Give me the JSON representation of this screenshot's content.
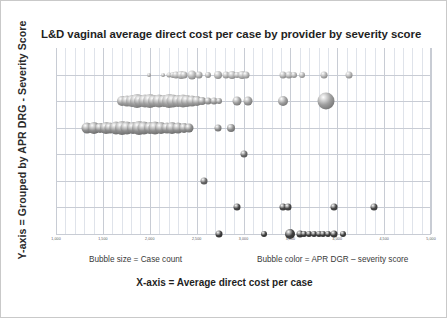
{
  "title": "L&D vaginal average direct cost per case by provider by severity score",
  "axes": {
    "y_caption": "Y-axis = Grouped by APR DRG - Severity Score",
    "x_caption": "X-axis = Average direct cost per case"
  },
  "captions": {
    "bubble_size": "Bubble size = Case count",
    "bubble_color": "Bubble color = APR DGR – severity score"
  },
  "colors": {
    "grid_major": "#c8ccd4",
    "grid_minor": "#dfe3ea",
    "bubble_light": "#b3b3b3",
    "bubble_mid": "#8a8a8a",
    "bubble_dark": "#3f3f3f",
    "title_text": "#1f1f1f",
    "tick_text": "#55585c",
    "frame": "#c9c9c9"
  },
  "chart_data": {
    "type": "scatter",
    "title": "L&D vaginal average direct cost per case by provider by severity score",
    "xlabel": "X-axis = Average direct cost per case",
    "ylabel": "Y-axis = Grouped by APR DRG - Severity Score",
    "grid": true,
    "legend": "none",
    "xlim": [
      1000,
      5000
    ],
    "xticks": [
      1000,
      1500,
      2000,
      2500,
      3000,
      3500,
      4000,
      4500,
      5000
    ],
    "xtick_labels": [
      "1,000",
      "1,500",
      "2,000",
      "2,500",
      "3,000",
      "3,500",
      "4,000",
      "4,500",
      "5,000"
    ],
    "x_minor_step": 100,
    "ylim": [
      0,
      7
    ],
    "yticks": [
      1,
      2,
      3,
      4,
      5,
      6
    ],
    "ytick_labels": [
      "",
      "",
      "",
      "",
      "",
      ""
    ],
    "size_encodes": "Case count",
    "color_encodes": "APR DGR – severity score",
    "series": [
      {
        "name": "Severity score row 1 (light)",
        "row": 1,
        "color": "#b3b3b3",
        "points": [
          {
            "x": 1990,
            "size": 4
          },
          {
            "x": 2140,
            "size": 4
          },
          {
            "x": 2210,
            "size": 5
          },
          {
            "x": 2245,
            "size": 6
          },
          {
            "x": 2280,
            "size": 7
          },
          {
            "x": 2330,
            "size": 8
          },
          {
            "x": 2370,
            "size": 7
          },
          {
            "x": 2450,
            "size": 9
          },
          {
            "x": 2530,
            "size": 7
          },
          {
            "x": 2620,
            "size": 6
          },
          {
            "x": 2730,
            "size": 8
          },
          {
            "x": 2810,
            "size": 7
          },
          {
            "x": 2880,
            "size": 8
          },
          {
            "x": 2930,
            "size": 6
          },
          {
            "x": 2980,
            "size": 8
          },
          {
            "x": 3030,
            "size": 7
          },
          {
            "x": 3420,
            "size": 7
          },
          {
            "x": 3490,
            "size": 7
          },
          {
            "x": 3540,
            "size": 6
          },
          {
            "x": 3620,
            "size": 6
          },
          {
            "x": 3860,
            "size": 7
          },
          {
            "x": 4130,
            "size": 7
          }
        ]
      },
      {
        "name": "Severity score row 2 (light, dense cluster)",
        "row": 2,
        "color": "#9e9e9e",
        "points": [
          {
            "x": 1700,
            "size": 10
          },
          {
            "x": 1760,
            "size": 11
          },
          {
            "x": 1810,
            "size": 12
          },
          {
            "x": 1860,
            "size": 14
          },
          {
            "x": 1900,
            "size": 12
          },
          {
            "x": 1950,
            "size": 13
          },
          {
            "x": 2000,
            "size": 14
          },
          {
            "x": 2050,
            "size": 12
          },
          {
            "x": 2100,
            "size": 13
          },
          {
            "x": 2150,
            "size": 12
          },
          {
            "x": 2200,
            "size": 14
          },
          {
            "x": 2250,
            "size": 13
          },
          {
            "x": 2300,
            "size": 12
          },
          {
            "x": 2350,
            "size": 13
          },
          {
            "x": 2400,
            "size": 12
          },
          {
            "x": 2450,
            "size": 11
          },
          {
            "x": 2500,
            "size": 10
          },
          {
            "x": 2560,
            "size": 8
          },
          {
            "x": 2620,
            "size": 7
          },
          {
            "x": 2680,
            "size": 7
          },
          {
            "x": 2740,
            "size": 6
          },
          {
            "x": 2930,
            "size": 9
          },
          {
            "x": 3050,
            "size": 9
          },
          {
            "x": 3420,
            "size": 10
          },
          {
            "x": 3880,
            "size": 17
          }
        ]
      },
      {
        "name": "Severity score row 3 (light, large cluster)",
        "row": 3,
        "color": "#8f8f8f",
        "points": [
          {
            "x": 1330,
            "size": 11
          },
          {
            "x": 1400,
            "size": 12
          },
          {
            "x": 1470,
            "size": 10
          },
          {
            "x": 1530,
            "size": 12
          },
          {
            "x": 1580,
            "size": 11
          },
          {
            "x": 1640,
            "size": 13
          },
          {
            "x": 1700,
            "size": 14
          },
          {
            "x": 1760,
            "size": 13
          },
          {
            "x": 1820,
            "size": 12
          },
          {
            "x": 1880,
            "size": 14
          },
          {
            "x": 1940,
            "size": 13
          },
          {
            "x": 2000,
            "size": 12
          },
          {
            "x": 2060,
            "size": 13
          },
          {
            "x": 2120,
            "size": 12
          },
          {
            "x": 2180,
            "size": 11
          },
          {
            "x": 2240,
            "size": 12
          },
          {
            "x": 2300,
            "size": 11
          },
          {
            "x": 2360,
            "size": 10
          },
          {
            "x": 2420,
            "size": 9
          },
          {
            "x": 2730,
            "size": 7
          },
          {
            "x": 2870,
            "size": 8
          }
        ]
      },
      {
        "name": "Severity score row 4",
        "row": 4,
        "color": "#6f6f6f",
        "points": [
          {
            "x": 3000,
            "size": 7
          }
        ]
      },
      {
        "name": "Severity score row 5",
        "row": 5,
        "color": "#6b6b6b",
        "points": [
          {
            "x": 2580,
            "size": 7
          }
        ]
      },
      {
        "name": "Severity score row 6 (dark)",
        "row": 6,
        "color": "#4a4a4a",
        "points": [
          {
            "x": 2930,
            "size": 7
          },
          {
            "x": 3420,
            "size": 7
          },
          {
            "x": 3470,
            "size": 7
          },
          {
            "x": 3960,
            "size": 7
          },
          {
            "x": 4390,
            "size": 7
          }
        ]
      },
      {
        "name": "Severity score row 7 (dark)",
        "row": 7,
        "color": "#3f3f3f",
        "points": [
          {
            "x": 2740,
            "size": 7
          },
          {
            "x": 3220,
            "size": 6
          },
          {
            "x": 3500,
            "size": 10
          },
          {
            "x": 3600,
            "size": 7
          },
          {
            "x": 3650,
            "size": 6
          },
          {
            "x": 3700,
            "size": 6
          },
          {
            "x": 3750,
            "size": 6
          },
          {
            "x": 3800,
            "size": 6
          },
          {
            "x": 3850,
            "size": 6
          },
          {
            "x": 3900,
            "size": 6
          },
          {
            "x": 3960,
            "size": 7
          },
          {
            "x": 4060,
            "size": 6
          }
        ]
      }
    ]
  }
}
